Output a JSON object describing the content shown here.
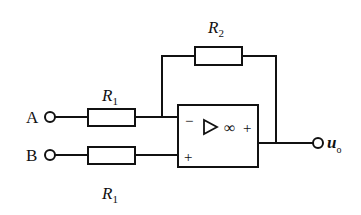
{
  "labels": {
    "r2": "R",
    "r2_sub": "2",
    "r1_top": "R",
    "r1_top_sub": "1",
    "r1_bottom": "R",
    "r1_bottom_sub": "1",
    "terminal_a": "A",
    "terminal_b": "B",
    "output": "u",
    "output_sub": "o"
  },
  "opamp": {
    "inverting_sign": "−",
    "noninverting_sign": "+",
    "infinity_symbol": "∞",
    "output_sign": "+"
  },
  "colors": {
    "stroke": "#111111",
    "background": "#ffffff"
  }
}
